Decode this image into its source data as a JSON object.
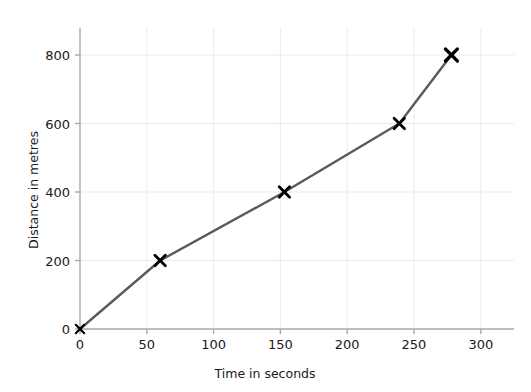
{
  "chart_data": {
    "type": "line",
    "title": "",
    "subtitle": "",
    "xlabel": "Time in seconds",
    "ylabel": "Distance in metres",
    "xlim": [
      0,
      325
    ],
    "ylim": [
      0,
      880
    ],
    "xticks": [
      0,
      50,
      100,
      150,
      200,
      250,
      300
    ],
    "xtick_labels": [
      "0",
      "50",
      "100",
      "150",
      "200",
      "250",
      "300"
    ],
    "yticks": [
      0,
      200,
      400,
      600,
      800
    ],
    "ytick_labels": [
      "0",
      "200",
      "400",
      "600",
      "800"
    ],
    "grid": true,
    "grid_color": "#ebebeb",
    "legend": false,
    "legend_position": "none",
    "marker": "x",
    "marker_color": "#000000",
    "line_color": "#5a5a5a",
    "axis_color": "#aaaaaa",
    "x": [
      0,
      60,
      153,
      239,
      278
    ],
    "y": [
      0,
      200,
      400,
      600,
      800
    ],
    "points": [
      {
        "x": 0,
        "y": 0
      },
      {
        "x": 60,
        "y": 200
      },
      {
        "x": 153,
        "y": 400
      },
      {
        "x": 239,
        "y": 600
      },
      {
        "x": 278,
        "y": 800
      }
    ],
    "series": [
      {
        "name": "Distance travelled",
        "x": [
          0,
          60,
          153,
          239,
          278
        ],
        "values": [
          0,
          200,
          400,
          600,
          800
        ]
      }
    ],
    "annotations": []
  }
}
